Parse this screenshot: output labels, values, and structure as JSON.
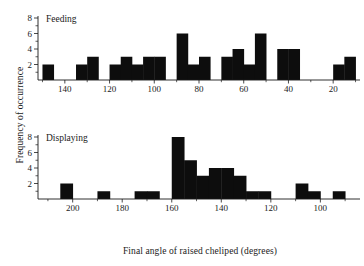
{
  "figure": {
    "ylabel": "Frequency of occurrence",
    "xlabel": "Final angle of raised cheliped  (degrees)",
    "bar_color": "#0d0d0d",
    "axis_color": "#1a1a1a",
    "background": "#ffffff"
  },
  "panels": [
    {
      "id": "feeding",
      "label": "Feeding"
    },
    {
      "id": "displaying",
      "label": "Displaying"
    }
  ],
  "chart_data": [
    {
      "type": "bar",
      "id": "feeding",
      "title": "Feeding",
      "xlabel": "Final angle of raised cheliped  (degrees)",
      "ylabel": "Frequency of occurrence",
      "xlim": [
        152,
        8
      ],
      "ylim": [
        0,
        8
      ],
      "x_inverted": true,
      "bin_width": 5,
      "grid": false,
      "legend": "none",
      "yticks": [
        2,
        4,
        6,
        8
      ],
      "yticks_minor": [
        1,
        3,
        5,
        7
      ],
      "xticks": [
        140,
        120,
        100,
        80,
        60,
        40,
        20
      ],
      "xticks_minor": [
        150,
        130,
        110,
        90,
        70,
        50,
        30,
        10
      ],
      "bins": [
        {
          "lo": 145,
          "hi": 150,
          "value": 2
        },
        {
          "lo": 140,
          "hi": 145,
          "value": 0
        },
        {
          "lo": 135,
          "hi": 140,
          "value": 0
        },
        {
          "lo": 130,
          "hi": 135,
          "value": 2
        },
        {
          "lo": 125,
          "hi": 130,
          "value": 3
        },
        {
          "lo": 120,
          "hi": 125,
          "value": 0
        },
        {
          "lo": 115,
          "hi": 120,
          "value": 2
        },
        {
          "lo": 110,
          "hi": 115,
          "value": 3
        },
        {
          "lo": 105,
          "hi": 110,
          "value": 2
        },
        {
          "lo": 100,
          "hi": 105,
          "value": 3
        },
        {
          "lo": 95,
          "hi": 100,
          "value": 3
        },
        {
          "lo": 90,
          "hi": 95,
          "value": 0
        },
        {
          "lo": 85,
          "hi": 90,
          "value": 6
        },
        {
          "lo": 80,
          "hi": 85,
          "value": 2
        },
        {
          "lo": 75,
          "hi": 80,
          "value": 3
        },
        {
          "lo": 70,
          "hi": 75,
          "value": 0
        },
        {
          "lo": 65,
          "hi": 70,
          "value": 3
        },
        {
          "lo": 60,
          "hi": 65,
          "value": 4
        },
        {
          "lo": 55,
          "hi": 60,
          "value": 2
        },
        {
          "lo": 50,
          "hi": 55,
          "value": 6
        },
        {
          "lo": 45,
          "hi": 50,
          "value": 0
        },
        {
          "lo": 40,
          "hi": 45,
          "value": 4
        },
        {
          "lo": 35,
          "hi": 40,
          "value": 4
        },
        {
          "lo": 30,
          "hi": 35,
          "value": 0
        },
        {
          "lo": 25,
          "hi": 30,
          "value": 0
        },
        {
          "lo": 20,
          "hi": 25,
          "value": 0
        },
        {
          "lo": 15,
          "hi": 20,
          "value": 2
        },
        {
          "lo": 10,
          "hi": 15,
          "value": 3
        }
      ]
    },
    {
      "type": "bar",
      "id": "displaying",
      "title": "Displaying",
      "xlabel": "Final angle of raised cheliped  (degrees)",
      "ylabel": "Frequency of occurrence",
      "xlim": [
        214,
        84
      ],
      "ylim": [
        0,
        8
      ],
      "x_inverted": true,
      "bin_width": 5,
      "grid": false,
      "legend": "none",
      "yticks": [
        2,
        4,
        6,
        8
      ],
      "yticks_minor": [
        1,
        3,
        5,
        7
      ],
      "xticks": [
        200,
        180,
        160,
        140,
        120,
        100
      ],
      "xticks_minor": [
        210,
        190,
        170,
        150,
        130,
        110,
        90
      ],
      "bins": [
        {
          "lo": 205,
          "hi": 210,
          "value": 0
        },
        {
          "lo": 200,
          "hi": 205,
          "value": 2
        },
        {
          "lo": 195,
          "hi": 200,
          "value": 0
        },
        {
          "lo": 190,
          "hi": 195,
          "value": 0
        },
        {
          "lo": 185,
          "hi": 190,
          "value": 1
        },
        {
          "lo": 180,
          "hi": 185,
          "value": 0
        },
        {
          "lo": 175,
          "hi": 180,
          "value": 0
        },
        {
          "lo": 170,
          "hi": 175,
          "value": 1
        },
        {
          "lo": 165,
          "hi": 170,
          "value": 1
        },
        {
          "lo": 160,
          "hi": 165,
          "value": 0
        },
        {
          "lo": 155,
          "hi": 160,
          "value": 8
        },
        {
          "lo": 150,
          "hi": 155,
          "value": 5
        },
        {
          "lo": 145,
          "hi": 150,
          "value": 3
        },
        {
          "lo": 140,
          "hi": 145,
          "value": 4
        },
        {
          "lo": 135,
          "hi": 140,
          "value": 4
        },
        {
          "lo": 130,
          "hi": 135,
          "value": 3
        },
        {
          "lo": 125,
          "hi": 130,
          "value": 1
        },
        {
          "lo": 120,
          "hi": 125,
          "value": 1
        },
        {
          "lo": 115,
          "hi": 120,
          "value": 0
        },
        {
          "lo": 110,
          "hi": 115,
          "value": 0
        },
        {
          "lo": 105,
          "hi": 110,
          "value": 2
        },
        {
          "lo": 100,
          "hi": 105,
          "value": 1
        },
        {
          "lo": 95,
          "hi": 100,
          "value": 0
        },
        {
          "lo": 90,
          "hi": 95,
          "value": 1
        },
        {
          "lo": 85,
          "hi": 90,
          "value": 0
        }
      ]
    }
  ]
}
